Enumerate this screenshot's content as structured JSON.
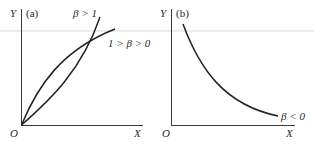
{
  "figure": {
    "colors": {
      "background": "#ffffff",
      "axis": "#3a3a3a",
      "curve": "#222222",
      "text": "#2a2a2a",
      "separator_line": "#cfcfcf"
    },
    "panels": [
      {
        "id": "a",
        "panel_label": "(a)",
        "y_axis_label": "Y",
        "x_axis_label": "X",
        "origin_label": "O",
        "curves": [
          {
            "name": "convex-curve",
            "label": "β > 1",
            "shape": "convex increasing from origin"
          },
          {
            "name": "concave-curve",
            "label": "1 > β > 0",
            "shape": "concave increasing from origin"
          }
        ]
      },
      {
        "id": "b",
        "panel_label": "(b)",
        "y_axis_label": "Y",
        "x_axis_label": "X",
        "origin_label": "O",
        "curves": [
          {
            "name": "decreasing-curve",
            "label": "β < 0",
            "shape": "convex decreasing"
          }
        ]
      }
    ]
  }
}
